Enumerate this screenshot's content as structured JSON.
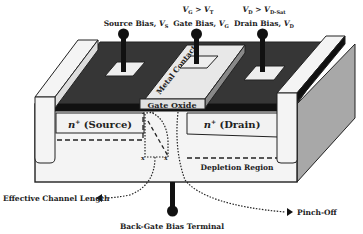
{
  "diagram": {
    "terminals": {
      "source": {
        "label": "Source Bias, ",
        "var": "V",
        "sub": "S"
      },
      "gate": {
        "label": "Gate Bias, ",
        "var": "V",
        "sub": "G",
        "condition_left_var": "V",
        "condition_left_sub": "G",
        "condition_op": " > ",
        "condition_right_var": "V",
        "condition_right_sub": "T"
      },
      "drain": {
        "label": "Drain Bias, ",
        "var": "V",
        "sub": "D",
        "condition_left_var": "V",
        "condition_left_sub": "D",
        "condition_op": " > ",
        "condition_right_var": "V",
        "condition_right_sub": "D-Sat"
      },
      "back_gate": {
        "label": "Back-Gate Bias Terminal"
      }
    },
    "regions": {
      "metal_contact": "Metal Contact",
      "gate_oxide": "Gate Oxide",
      "source": {
        "prefix": "n",
        "sup": "+",
        "text": " (Source)"
      },
      "drain": {
        "prefix": "n",
        "sup": "+",
        "text": " (Drain)"
      },
      "depletion": "Depletion Region"
    },
    "annotations": {
      "effective_channel_length": "Effective Channel Length",
      "pinch_off": "Pinch-Off"
    },
    "colors": {
      "dark_surface": "#333333",
      "black_layer": "#111111",
      "light_fill": "#f2f2f2",
      "side_face": "#a8a8a8",
      "pillar": "#f4f4f4",
      "outline": "#222222"
    }
  }
}
